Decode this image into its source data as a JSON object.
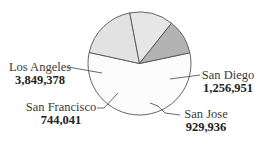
{
  "chart_data": {
    "type": "pie",
    "title": "",
    "categories": [
      "Los Angeles",
      "San Diego",
      "San Jose",
      "San Francisco"
    ],
    "values": [
      3849378,
      1256951,
      929936,
      744041
    ],
    "value_labels": [
      "3,849,378",
      "1,256,951",
      "929,936",
      "744,041"
    ],
    "colors": [
      "#fbfbfb",
      "#e2e2e2",
      "#e6e6e6",
      "#b3b3b3"
    ],
    "start_angle_deg": -12,
    "direction": "clockwise",
    "legend": "none",
    "labels_with_leader_lines": true
  },
  "labels": {
    "los_angeles": {
      "name": "Los Angeles",
      "value": "3,849,378"
    },
    "san_diego": {
      "name": "San Diego",
      "value": "1,256,951"
    },
    "san_jose": {
      "name": "San Jose",
      "value": "929,936"
    },
    "san_francisco": {
      "name": "San Francisco",
      "value": "744,041"
    }
  }
}
